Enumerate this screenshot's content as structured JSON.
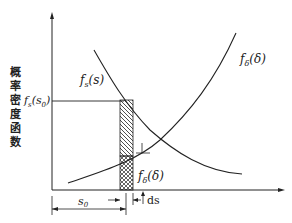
{
  "diagram": {
    "y_axis_label": "概率密度函数",
    "curves": {
      "stress": {
        "label_f": "f",
        "label_sub": "s",
        "label_arg": "(s)"
      },
      "strength": {
        "label_f": "f",
        "label_sub": "δ",
        "label_arg": "(δ)"
      }
    },
    "fs_s0": {
      "label_f": "f",
      "label_sub": "s",
      "label_arg": "(s",
      "label_arg_sub": "0",
      "label_close": ")"
    },
    "fdelta_lower": {
      "label_f": "f",
      "label_sub": "δ",
      "label_arg": "(δ)"
    },
    "dimensions": {
      "s0": {
        "label": "s",
        "sub": "0"
      },
      "ds": {
        "label": "ds"
      }
    },
    "colors": {
      "line": "#222222",
      "background": "#ffffff"
    }
  }
}
